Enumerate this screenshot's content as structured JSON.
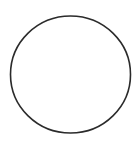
{
  "shape": {
    "type": "circle-outline",
    "cx": 70.5,
    "cy": 74.5,
    "rx": 60,
    "ry": 58.5,
    "stroke": "#2b2b2b",
    "stroke_width": 1.6,
    "fill": "none"
  },
  "background": "#ffffff"
}
